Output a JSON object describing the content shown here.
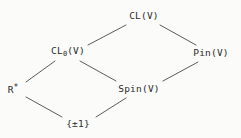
{
  "diagram": {
    "kind": "lattice-diagram",
    "background_color": "#fbfbf9",
    "text_color": "#2b2b2b",
    "edge_color": "#4a4a4a",
    "nodes": [
      {
        "id": "cl",
        "label": "CL(V)",
        "base": "CL",
        "sub": "",
        "sup": "",
        "x": 144,
        "y": 16
      },
      {
        "id": "cl0",
        "label": "CL0(V)",
        "base": "CL",
        "sub": "0",
        "sup": "",
        "tail": "(V)",
        "x": 68,
        "y": 52
      },
      {
        "id": "pin",
        "label": "Pin(V)",
        "base": "Pin",
        "sub": "",
        "sup": "",
        "x": 211,
        "y": 53
      },
      {
        "id": "rstar",
        "label": "R*",
        "base": "R",
        "sub": "",
        "sup": "*",
        "x": 13,
        "y": 89
      },
      {
        "id": "spin",
        "label": "Spin(V)",
        "base": "Spin",
        "sub": "",
        "sup": "",
        "x": 139,
        "y": 89
      },
      {
        "id": "pm1",
        "label": "{±1}",
        "base": "{±1}",
        "sub": "",
        "sup": "",
        "x": 78,
        "y": 124
      }
    ],
    "edges": [
      {
        "id": "e-cl0-cl",
        "from": "cl0",
        "to": "cl",
        "x1": 88,
        "y1": 45,
        "x2": 126,
        "y2": 25
      },
      {
        "id": "e-cl-pin",
        "from": "cl",
        "to": "pin",
        "x1": 160,
        "y1": 25,
        "x2": 196,
        "y2": 45
      },
      {
        "id": "e-rstar-cl0",
        "from": "rstar",
        "to": "cl0",
        "x1": 26,
        "y1": 82,
        "x2": 55,
        "y2": 61
      },
      {
        "id": "e-cl0-spin",
        "from": "cl0",
        "to": "spin",
        "x1": 80,
        "y1": 61,
        "x2": 116,
        "y2": 81
      },
      {
        "id": "e-spin-pin",
        "from": "spin",
        "to": "pin",
        "x1": 163,
        "y1": 81,
        "x2": 198,
        "y2": 62
      },
      {
        "id": "e-rstar-pm1",
        "from": "rstar",
        "to": "pm1",
        "x1": 26,
        "y1": 97,
        "x2": 62,
        "y2": 117
      },
      {
        "id": "e-pm1-spin",
        "from": "pm1",
        "to": "spin",
        "x1": 96,
        "y1": 117,
        "x2": 126,
        "y2": 98
      }
    ]
  }
}
